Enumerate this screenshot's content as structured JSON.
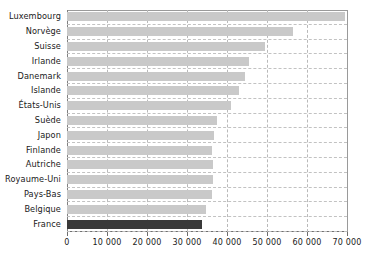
{
  "chart_data": {
    "type": "bar",
    "orientation": "horizontal",
    "title": "",
    "subtitle": "",
    "xlabel": "",
    "ylabel": "",
    "xlim": [
      0,
      70000
    ],
    "xticks": [
      0,
      10000,
      20000,
      30000,
      40000,
      50000,
      60000,
      70000
    ],
    "xtick_labels": [
      "0",
      "10 000",
      "20 000",
      "30 000",
      "40 000",
      "50 000",
      "60 000",
      "70 000"
    ],
    "grid": "vertical-dashed-and-horizontal-dashed",
    "legend": "none",
    "categories": [
      "Luxembourg",
      "Norvège",
      "Suisse",
      "Irlande",
      "Danemark",
      "Islande",
      "États-Unis",
      "Suède",
      "Japon",
      "Finlande",
      "Autriche",
      "Royaume-Uni",
      "Pays-Bas",
      "Belgique",
      "France"
    ],
    "values": [
      69500,
      56500,
      49500,
      45500,
      44500,
      43000,
      41000,
      37500,
      36750,
      36250,
      36500,
      36500,
      36250,
      34750,
      33750
    ],
    "colors": {
      "bar": "#c9c9c9",
      "highlight_bar": "#3a3a3a",
      "grid": "#bfbfbf",
      "axis": "#6e6e6e",
      "text": "#1a1a1a",
      "background": "#ffffff"
    },
    "highlight_category": "France"
  }
}
